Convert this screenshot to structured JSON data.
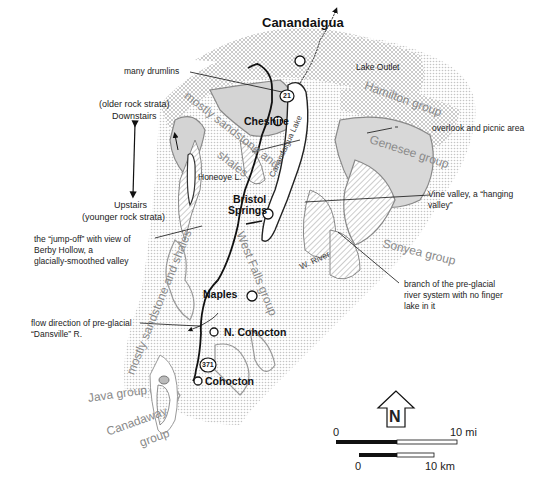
{
  "map": {
    "towns": [
      {
        "name": "Canandaigua",
        "x": 262,
        "y": 22
      },
      {
        "name": "Cheshire",
        "x": 244,
        "y": 113
      },
      {
        "name": "Bristol",
        "x": 237,
        "y": 192
      },
      {
        "name": "Springs",
        "x": 231,
        "y": 204
      },
      {
        "name": "Naples",
        "x": 203,
        "y": 290
      },
      {
        "name": "N. Cohocton",
        "x": 224,
        "y": 327
      },
      {
        "name": "Cohocton",
        "x": 205,
        "y": 377
      }
    ],
    "route_shields": [
      "21",
      "371"
    ],
    "features": {
      "lake_outlet": "Lake Outlet",
      "canandaigua_lake": "Canandaigua Lake",
      "honeoye_lake": "Honeoye L.",
      "west_river": "W. River"
    },
    "groups": [
      {
        "name": "Hamilton group"
      },
      {
        "name": "Genesee group"
      },
      {
        "name": "Sonyea group"
      },
      {
        "name": "West Falls group"
      },
      {
        "name": "Java group"
      },
      {
        "name": "Canadaway group"
      },
      {
        "name": "mostly sandstone and shales (north)"
      },
      {
        "name": "mostly sandstone and shales (south)"
      }
    ],
    "group_labels": {
      "hamilton": "Hamilton group",
      "genesee": "Genesee group",
      "sonyea": "Sonyea group",
      "west_falls": "West Falls group",
      "java": "Java group",
      "canadaway_1": "Canadaway",
      "canadaway_2": "group",
      "sandstone_north": "mostly sandstone and",
      "sandstone_north_2": "shales",
      "sandstone_south": "mostly sandstone and shales"
    },
    "annotations": {
      "drumlins": "many drumlins",
      "strata_older_1": "(older rock strata)",
      "strata_older_2": "Downstairs",
      "strata_younger_1": "Upstairs",
      "strata_younger_2": "(younger rock strata)",
      "jumpoff_1": "the “jump-off” with view of",
      "jumpoff_2": "Berby Hollow, a",
      "jumpoff_3": "glacially-smoothed valley",
      "flow_1": "flow direction of pre-glacial",
      "flow_2": "“Dansville” R.",
      "overlook": "overlook and picnic area",
      "vine_1": "Vine valley, a “hanging",
      "vine_2": "valley”",
      "branch_1": "branch of the pre-glacial",
      "branch_2": "river system with no finger",
      "branch_3": "lake in it"
    },
    "north_arrow": "N",
    "scale": {
      "mi_start": "0",
      "mi_end": "10 mi",
      "km_start": "0",
      "km_end": "10 km"
    },
    "colors": {
      "crosshatch": "#bdbdbd",
      "gray_fill": "#d6d6d6",
      "label_gray": "#8a8a8a",
      "ink": "#1a1a1a"
    }
  }
}
